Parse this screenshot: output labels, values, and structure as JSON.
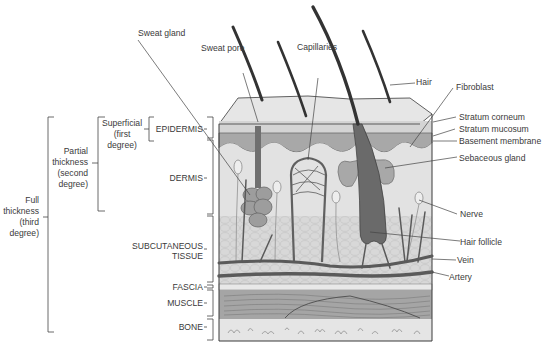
{
  "diagram": {
    "left_labels": {
      "full": [
        "Full",
        "thickness",
        "(third",
        "degree)"
      ],
      "partial": [
        "Partial",
        "thickness",
        "(second",
        "degree)"
      ],
      "superficial": [
        "Superficial",
        "(first",
        "degree)"
      ]
    },
    "layers": {
      "epidermis": "EPIDERMIS",
      "dermis": "DERMIS",
      "subcutaneous": [
        "SUBCUTANEOUS",
        "TISSUE"
      ],
      "fascia": "FASCIA",
      "muscle": "MUSCLE",
      "bone": "BONE"
    },
    "top_labels": {
      "sweat_gland": "Sweat gland",
      "sweat_pore": "Sweat pore",
      "capillaries": "Capillaries",
      "hair": "Hair"
    },
    "right_labels": {
      "fibroblast": "Fibroblast",
      "stratum_corneum": "Stratum corneum",
      "stratum_mucosum": "Stratum mucosum",
      "basement_membrane": "Basement membrane",
      "sebaceous_gland": "Sebaceous gland",
      "nerve": "Nerve",
      "hair_follicle": "Hair follicle",
      "vein": "Vein",
      "artery": "Artery"
    },
    "colors": {
      "epidermis_top": "#d9d9d9",
      "epidermis_mucosum": "#a9a9a9",
      "dermis": "#e3e3e3",
      "subcutaneous": "#d6d6d6",
      "vessel": "#5f5f5f",
      "muscle": "#a6a6a6",
      "bone": "#e4e4e4",
      "gland": "#9a9a9a",
      "outline": "#3a3a3a"
    }
  }
}
